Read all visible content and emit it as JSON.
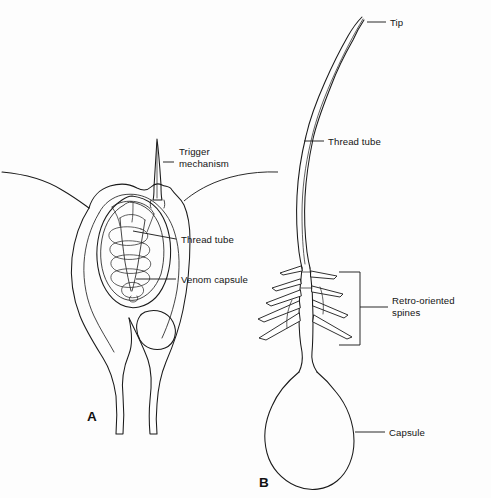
{
  "figure": {
    "background_color": "#fdfdfd",
    "ink_color": "#1a1a1a",
    "width": 491,
    "height": 498
  },
  "panels": [
    {
      "letter": "A",
      "caption": "Undischarged nematocyst within cnidocyte",
      "labels": [
        {
          "id": "trigger",
          "line1": "Trigger",
          "line2": "mechanism"
        },
        {
          "id": "thread_tube_a",
          "text": "Thread tube"
        },
        {
          "id": "venom_capsule",
          "text": "Venom capsule"
        }
      ]
    },
    {
      "letter": "B",
      "caption": "Discharged nematocyst thread",
      "labels": [
        {
          "id": "tip",
          "text": "Tip"
        },
        {
          "id": "thread_tube_b",
          "text": "Thread tube"
        },
        {
          "id": "spines",
          "line1": "Retro-oriented",
          "line2": "spines"
        },
        {
          "id": "capsule",
          "text": "Capsule"
        }
      ]
    }
  ],
  "labels": {
    "trigger_line1": "Trigger",
    "trigger_line2": "mechanism",
    "thread_tube_a": "Thread tube",
    "venom_capsule": "Venom capsule",
    "tip": "Tip",
    "thread_tube_b": "Thread tube",
    "spines_line1": "Retro-oriented",
    "spines_line2": "spines",
    "capsule": "Capsule",
    "panel_a": "A",
    "panel_b": "B"
  }
}
